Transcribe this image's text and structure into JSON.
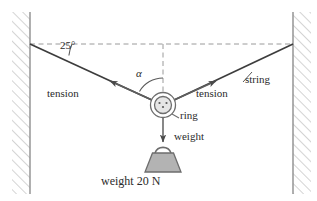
{
  "figure": {
    "type": "physics-force-diagram",
    "background_color": "#ffffff",
    "line_color": "#3a3a3a",
    "dash_color": "#8a8a8a",
    "fill_color": "#b5b5b5",
    "wall_hatch_color": "#b9b9b9"
  },
  "labels": {
    "angle_wall": "25°",
    "angle_alpha": "α",
    "tension_left": "tension",
    "tension_right": "tension",
    "string": "string",
    "ring": "ring",
    "weight_arrow": "weight",
    "weight_value": "weight 20 N"
  },
  "physics_data": {
    "angle_from_horizontal_deg": 25,
    "angle_alpha_description": "angle between left tension and vertical dashed line",
    "weight_magnitude": 20,
    "weight_unit": "N",
    "forces": [
      {
        "name": "tension-left",
        "direction": "up-left",
        "label": "tension"
      },
      {
        "name": "tension-right",
        "direction": "up-right",
        "label": "tension"
      },
      {
        "name": "weight",
        "direction": "down",
        "label": "weight",
        "magnitude": 20,
        "unit": "N"
      }
    ],
    "supports": [
      "left-wall",
      "right-wall"
    ],
    "object": "ring"
  },
  "geometry": {
    "left_wall_x": 30,
    "right_wall_x": 293,
    "anchor_y": 44,
    "ring_center_x": 163,
    "ring_center_y": 105,
    "ring_outer_radius": 13,
    "ring_inner_radius": 9
  }
}
